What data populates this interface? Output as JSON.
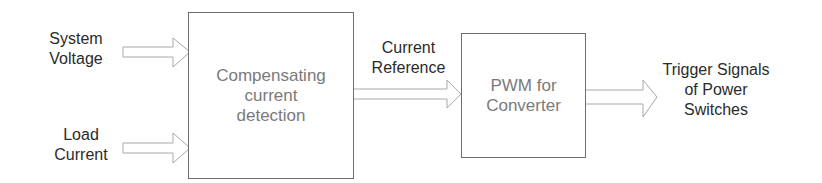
{
  "diagram": {
    "inputs": [
      {
        "label_line1": "System",
        "label_line2": "Voltage"
      },
      {
        "label_line1": "Load",
        "label_line2": "Current"
      }
    ],
    "blocks": [
      {
        "id": "compensating",
        "line1": "Compensating",
        "line2": "current",
        "line3": "detection"
      },
      {
        "id": "pwm",
        "line1": "PWM for",
        "line2": "Converter"
      }
    ],
    "intermediate": {
      "label_line1": "Current",
      "label_line2": "Reference"
    },
    "output": {
      "label_line1": "Trigger Signals",
      "label_line2": "of Power",
      "label_line3": "Switches"
    },
    "colors": {
      "box_border": "#6e6e6e",
      "arrow_stroke": "#a8a8a8",
      "block_text": "#7a7a7a",
      "label_text": "#2b2b2b"
    }
  }
}
